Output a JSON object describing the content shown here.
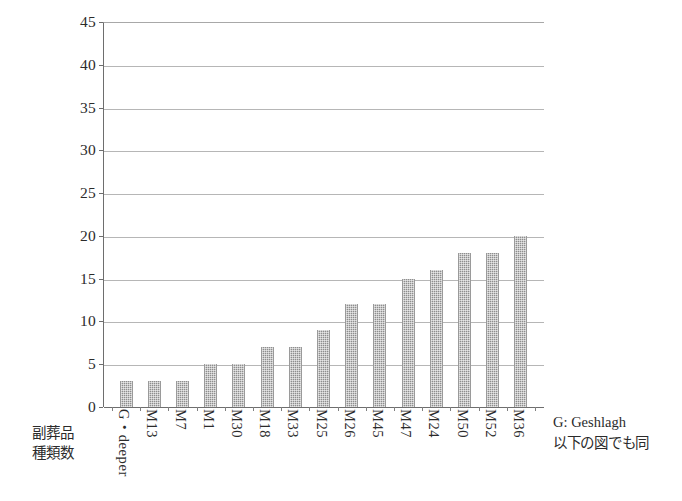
{
  "chart_data": {
    "type": "bar",
    "title": "",
    "xlabel": "",
    "ylabel": "副葬品\n種類数",
    "ylim": [
      0,
      45
    ],
    "ytick_step": 5,
    "yticks": [
      0,
      5,
      10,
      15,
      20,
      25,
      30,
      35,
      40,
      45
    ],
    "grid": true,
    "legend_position": "right-bottom",
    "categories": [
      "G・deeper",
      "M13",
      "M7",
      "M1",
      "M30",
      "M18",
      "M33",
      "M25",
      "M26",
      "M45",
      "M47",
      "M24",
      "M50",
      "M52",
      "M36"
    ],
    "values": [
      3,
      3,
      3,
      5,
      5,
      7,
      7,
      9,
      12,
      12,
      15,
      16,
      18,
      18,
      20
    ],
    "series": [
      {
        "name": "副葬品種類数",
        "values": [
          3,
          3,
          3,
          5,
          5,
          7,
          7,
          9,
          12,
          12,
          15,
          16,
          18,
          18,
          20
        ]
      }
    ],
    "annotations": [
      "G: Geshlagh",
      "以下の図でも同"
    ],
    "bar_color": "#8e8e8e",
    "axis_color": "#6e6e6e",
    "gridline_color": "#b6b6b6"
  },
  "axis": {
    "y_title_line1": "副葬品",
    "y_title_line2": "種類数"
  },
  "legend": {
    "abbreviation_note": "G: Geshlagh",
    "figure_note": "以下の図でも同"
  },
  "caption": {
    "text": ""
  }
}
